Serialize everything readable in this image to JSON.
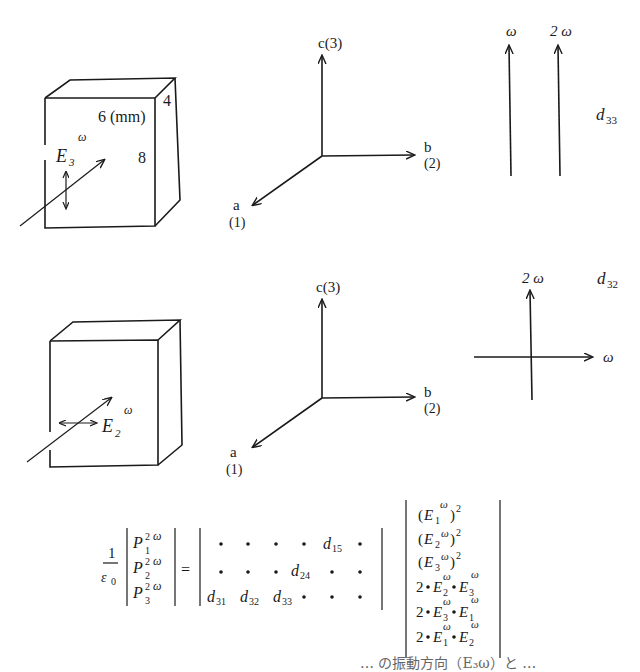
{
  "figure": {
    "top": {
      "crystal": {
        "dims_label": "6 (mm)",
        "depth_label": "4",
        "height_label": "8",
        "field_label": "E",
        "field_sub": "3",
        "field_sup": "ω"
      },
      "axes": {
        "c": "c(3)",
        "b": "b",
        "b_idx": "(2)",
        "a": "a",
        "a_idx": "(1)"
      },
      "polarization": {
        "fund": "ω",
        "harm": "2 ω",
        "coef": "d",
        "coef_sub": "33"
      }
    },
    "bottom": {
      "crystal": {
        "field_label": "E",
        "field_sub": "2",
        "field_sup": "ω"
      },
      "axes": {
        "c": "c(3)",
        "b": "b",
        "b_idx": "(2)",
        "a": "a",
        "a_idx": "(1)"
      },
      "polarization": {
        "harm": "2 ω",
        "fund": "ω",
        "coef": "d",
        "coef_sub": "32"
      }
    },
    "equation": {
      "prefactor_num": "1",
      "prefactor_den": "ε",
      "prefactor_den_sub": "0",
      "lhs": [
        "P₁²ω",
        "P₂²ω",
        "P₃²ω"
      ],
      "tensor_rows": [
        [
          "•",
          "•",
          "•",
          "•",
          "d15",
          "•"
        ],
        [
          "•",
          "•",
          "•",
          "d24",
          "•",
          "•"
        ],
        [
          "d31",
          "d32",
          "d33",
          "•",
          "•",
          "•"
        ]
      ],
      "rhs": [
        "(E₁ω)²",
        "(E₂ω)²",
        "(E₃ω)²",
        "2•E₂ω•E₃ω",
        "2•E₃ω•E₁ω",
        "2•E₁ω•E₂ω"
      ],
      "equals": "="
    },
    "footer_partial": "… の振動方向（E₃ω）と …"
  }
}
